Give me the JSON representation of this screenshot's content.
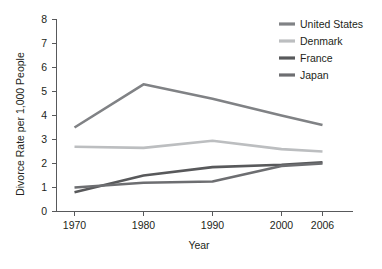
{
  "chart_data": {
    "type": "line",
    "title": "",
    "xlabel": "Year",
    "ylabel": "Divorce Rate per 1,000 People",
    "categories": [
      "1970",
      "1980",
      "1990",
      "2000",
      "2006"
    ],
    "x": [
      1970,
      1980,
      1990,
      2000,
      2006
    ],
    "xlim": [
      1970,
      2006
    ],
    "ylim": [
      0,
      8
    ],
    "yticks": [
      "0",
      "1",
      "2",
      "3",
      "4",
      "5",
      "6",
      "7",
      "8"
    ],
    "grid": false,
    "legend_position": "top-right",
    "series": [
      {
        "name": "United States",
        "color": "#808285",
        "values": [
          3.5,
          5.3,
          4.7,
          4.0,
          3.6
        ]
      },
      {
        "name": "Denmark",
        "color": "#bcbec0",
        "values": [
          2.7,
          2.65,
          2.95,
          2.6,
          2.5
        ]
      },
      {
        "name": "France",
        "color": "#58595b",
        "values": [
          0.8,
          1.5,
          1.85,
          1.95,
          2.05
        ]
      },
      {
        "name": "Japan",
        "color": "#6d6e71",
        "values": [
          1.0,
          1.2,
          1.25,
          1.9,
          2.0
        ]
      }
    ]
  },
  "axes": {
    "y_title": "Divorce Rate per 1,000 People",
    "x_title": "Year",
    "y_tick_labels": [
      "8",
      "7",
      "6",
      "5",
      "4",
      "3",
      "2",
      "1",
      "0"
    ],
    "x_tick_labels": [
      "1970",
      "1980",
      "1990",
      "2000",
      "2006"
    ]
  },
  "legend": {
    "items": [
      {
        "label": "United States",
        "color": "#808285"
      },
      {
        "label": "Denmark",
        "color": "#bcbec0"
      },
      {
        "label": "France",
        "color": "#58595b"
      },
      {
        "label": "Japan",
        "color": "#6d6e71"
      }
    ]
  }
}
